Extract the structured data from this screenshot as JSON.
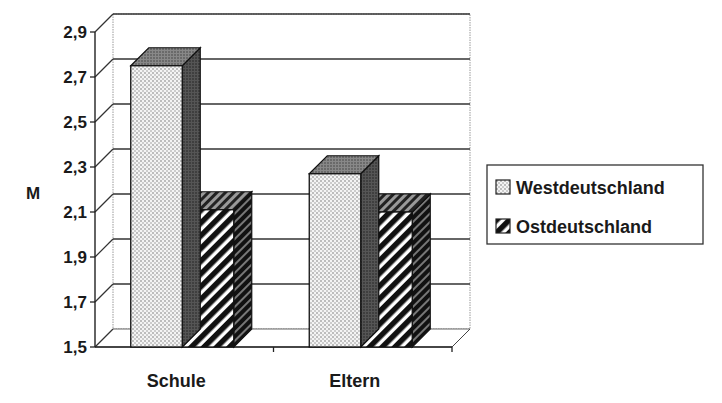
{
  "chart_data": {
    "type": "bar",
    "style": "3d-clustered-column",
    "title": "",
    "xlabel": "",
    "ylabel": "M",
    "ylim": [
      1.5,
      2.9
    ],
    "yticks": [
      1.5,
      1.7,
      1.9,
      2.1,
      2.3,
      2.5,
      2.7,
      2.9
    ],
    "ytick_labels": [
      "1,5",
      "1,7",
      "1,9",
      "2,1",
      "2,3",
      "2,5",
      "2,7",
      "2,9"
    ],
    "categories": [
      "Schule",
      "Eltern"
    ],
    "series": [
      {
        "name": "Westdeutschland",
        "pattern": "dots",
        "values": [
          2.75,
          2.27
        ]
      },
      {
        "name": "Ostdeutschland",
        "pattern": "diagonal-stripes",
        "values": [
          2.11,
          2.1
        ]
      }
    ],
    "grid": true,
    "legend_position": "right",
    "colors": {
      "ink": "#1a1a1a",
      "grid": "#333333",
      "wall_grid": "#888888",
      "background": "#ffffff"
    }
  }
}
